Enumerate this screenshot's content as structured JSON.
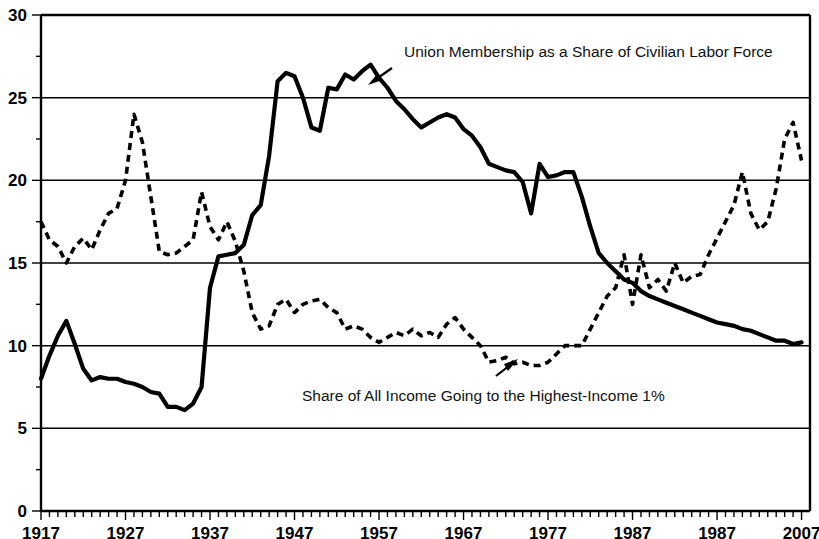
{
  "chart_data": {
    "type": "line",
    "title": "",
    "xlabel": "",
    "ylabel": "",
    "xlim": [
      1917,
      2008
    ],
    "ylim": [
      0,
      30
    ],
    "grid": true,
    "legend_position": "inline-annotations",
    "y_ticks": [
      "0",
      "5",
      "10",
      "15",
      "20",
      "25",
      "30"
    ],
    "y_tick_values": [
      0,
      5,
      10,
      15,
      20,
      25,
      30
    ],
    "x_ticks": [
      "1917",
      "1927",
      "1937",
      "1947",
      "1957",
      "1967",
      "1977",
      "1987",
      "1987",
      "2007"
    ],
    "x_tick_values": [
      1917,
      1927,
      1937,
      1947,
      1957,
      1967,
      1977,
      1987,
      1997,
      2007
    ],
    "x_tick_interval_years": 1,
    "annotations": [
      {
        "id": "union-label",
        "text": "Union Membership as a Share of Civilian Labor Force",
        "points_to_series": "Union Membership as a Share of Civilian Labor Force"
      },
      {
        "id": "income-label",
        "text": "Share of All Income Going to the Highest-Income 1%",
        "points_to_series": "Share of All Income Going to the Highest-Income 1%"
      }
    ],
    "series": [
      {
        "name": "Union Membership as a Share of Civilian Labor Force",
        "style": "solid",
        "color": "#000000",
        "x": [
          1917,
          1918,
          1919,
          1920,
          1921,
          1922,
          1923,
          1924,
          1925,
          1926,
          1927,
          1928,
          1929,
          1930,
          1931,
          1932,
          1933,
          1934,
          1935,
          1936,
          1937,
          1938,
          1939,
          1940,
          1941,
          1942,
          1943,
          1944,
          1945,
          1946,
          1947,
          1948,
          1949,
          1950,
          1951,
          1952,
          1953,
          1954,
          1955,
          1956,
          1957,
          1958,
          1959,
          1960,
          1961,
          1962,
          1963,
          1964,
          1965,
          1966,
          1967,
          1968,
          1969,
          1970,
          1971,
          1972,
          1973,
          1974,
          1975,
          1976,
          1977,
          1978,
          1979,
          1980,
          1981,
          1982,
          1983,
          1984,
          1985,
          1986,
          1987,
          1988,
          1989,
          1990,
          1991,
          1992,
          1993,
          1994,
          1995,
          1996,
          1997,
          1998,
          1999,
          2000,
          2001,
          2002,
          2003,
          2004,
          2005,
          2006,
          2007
        ],
        "values": [
          8.0,
          9.4,
          10.6,
          11.5,
          10.1,
          8.6,
          7.9,
          8.1,
          8.0,
          8.0,
          7.8,
          7.7,
          7.5,
          7.2,
          7.1,
          6.3,
          6.3,
          6.1,
          6.5,
          7.5,
          13.5,
          15.4,
          15.5,
          15.6,
          16.1,
          17.9,
          18.5,
          21.5,
          26.0,
          26.5,
          26.3,
          25.0,
          23.2,
          23.0,
          25.6,
          25.5,
          26.4,
          26.1,
          26.6,
          27.0,
          26.2,
          25.6,
          24.8,
          24.3,
          23.7,
          23.2,
          23.5,
          23.8,
          24.0,
          23.8,
          23.1,
          22.7,
          22.0,
          21.0,
          20.8,
          20.6,
          20.5,
          19.9,
          18.0,
          21.0,
          20.2,
          20.3,
          20.5,
          20.5,
          19.0,
          17.2,
          15.6,
          15.0,
          14.5,
          14.0,
          13.8,
          13.3,
          13.0,
          12.8,
          12.6,
          12.4,
          12.2,
          12.0,
          11.8,
          11.6,
          11.4,
          11.3,
          11.2,
          11.0,
          10.9,
          10.7,
          10.5,
          10.3,
          10.3,
          10.1,
          10.2
        ]
      },
      {
        "name": "Share of All Income Going to the Highest-Income 1%",
        "style": "dashed",
        "color": "#000000",
        "x": [
          1917,
          1918,
          1919,
          1920,
          1921,
          1922,
          1923,
          1924,
          1925,
          1926,
          1927,
          1928,
          1929,
          1930,
          1931,
          1932,
          1933,
          1934,
          1935,
          1936,
          1937,
          1938,
          1939,
          1940,
          1941,
          1942,
          1943,
          1944,
          1945,
          1946,
          1947,
          1948,
          1949,
          1950,
          1951,
          1952,
          1953,
          1954,
          1955,
          1956,
          1957,
          1958,
          1959,
          1960,
          1961,
          1962,
          1963,
          1964,
          1965,
          1966,
          1967,
          1968,
          1969,
          1970,
          1971,
          1972,
          1973,
          1974,
          1975,
          1976,
          1977,
          1978,
          1979,
          1980,
          1981,
          1982,
          1983,
          1984,
          1985,
          1986,
          1987,
          1988,
          1989,
          1990,
          1991,
          1992,
          1993,
          1994,
          1995,
          1996,
          1997,
          1998,
          1999,
          2000,
          2001,
          2002,
          2003,
          2004,
          2005,
          2006,
          2007
        ],
        "values": [
          17.5,
          16.4,
          16.0,
          15.0,
          16.0,
          16.5,
          15.8,
          17.0,
          18.0,
          18.3,
          20.0,
          24.0,
          22.3,
          19.0,
          15.7,
          15.5,
          15.6,
          16.0,
          16.4,
          19.3,
          17.2,
          16.4,
          17.5,
          16.3,
          14.5,
          12.0,
          11.0,
          11.2,
          12.5,
          12.8,
          12.0,
          12.5,
          12.7,
          12.8,
          12.3,
          12.0,
          11.0,
          11.2,
          11.0,
          10.5,
          10.2,
          10.5,
          10.8,
          10.6,
          11.0,
          10.6,
          10.8,
          10.5,
          11.3,
          11.7,
          11.0,
          10.5,
          10.0,
          9.0,
          9.1,
          9.3,
          8.9,
          9.0,
          8.8,
          8.8,
          9.0,
          9.5,
          10.0,
          10.0,
          10.0,
          11.0,
          12.0,
          13.0,
          13.5,
          15.5,
          12.5,
          15.5,
          13.5,
          14.0,
          13.3,
          15.0,
          13.8,
          14.2,
          14.3,
          15.5,
          16.5,
          17.5,
          18.5,
          20.5,
          18.0,
          17.0,
          17.5,
          19.5,
          22.5,
          23.5,
          21.2
        ]
      }
    ]
  }
}
